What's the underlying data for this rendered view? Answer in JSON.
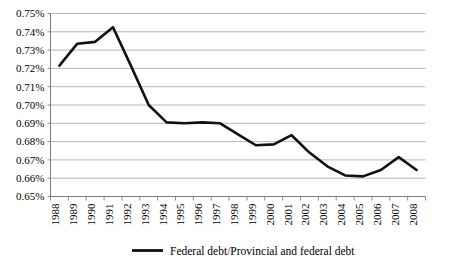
{
  "chart_data": {
    "type": "line",
    "title": "",
    "subtitle": "",
    "xlabel": "",
    "ylabel": "",
    "grid": true,
    "legend_position": "bottom",
    "ylim": [
      0.0065,
      0.0075
    ],
    "ytick_labels": [
      "0.75%",
      "0.74%",
      "0.73%",
      "0.72%",
      "0.71%",
      "0.70%",
      "0.69%",
      "0.68%",
      "0.67%",
      "0.66%",
      "0.65%"
    ],
    "ytick_values": [
      0.0075,
      0.0074,
      0.0073,
      0.0072,
      0.0071,
      0.007,
      0.0069,
      0.0068,
      0.0067,
      0.0066,
      0.0065
    ],
    "categories": [
      "1988",
      "1989",
      "1990",
      "1991",
      "1992",
      "1993",
      "1994",
      "1995",
      "1996",
      "1997",
      "1998",
      "1999",
      "2000",
      "2001",
      "2002",
      "2003",
      "2004",
      "2005",
      "2006",
      "2007",
      "2008"
    ],
    "series": [
      {
        "name": "Federal debt/Provincial and federal debt",
        "color": "#111111",
        "values": [
          0.7215,
          0.7335,
          0.7345,
          0.7425,
          0.7215,
          0.7,
          0.6905,
          0.69,
          0.6905,
          0.69,
          0.684,
          0.678,
          0.6785,
          0.6835,
          0.674,
          0.6665,
          0.6615,
          0.661,
          0.6645,
          0.6715,
          0.6645
        ],
        "value_unit": "%"
      }
    ],
    "legend": [
      {
        "label": "Federal debt/Provincial and federal debt",
        "color": "#111111",
        "marker": "line"
      }
    ]
  }
}
